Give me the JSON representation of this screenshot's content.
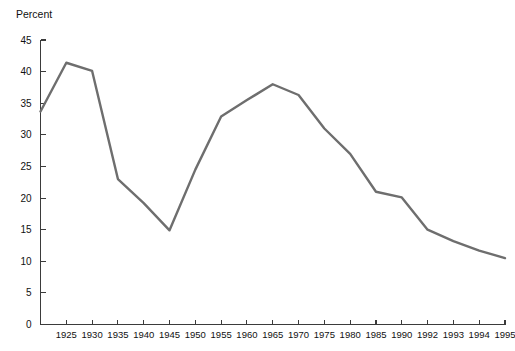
{
  "chart_data": {
    "type": "line",
    "title": "",
    "subtitle": "",
    "ylabel": "Percent",
    "xlabel": "",
    "ylim": [
      0,
      45
    ],
    "ytick_values": [
      0,
      5,
      10,
      15,
      20,
      25,
      30,
      35,
      40,
      45
    ],
    "ytick_labels": [
      "0",
      "5",
      "10",
      "15",
      "20",
      "25",
      "30",
      "35",
      "40",
      "45"
    ],
    "grid": false,
    "legend": false,
    "legend_position": "none",
    "line_color": "#6e6e6e",
    "axis_color": "#3b3b3b",
    "categories": [
      "1920",
      "1925",
      "1930",
      "1935",
      "1940",
      "1945",
      "1950",
      "1955",
      "1960",
      "1965",
      "1970",
      "1975",
      "1980",
      "1985",
      "1990",
      "1992",
      "1993",
      "1994",
      "1995"
    ],
    "xtick_labels": [
      "",
      "1925",
      "1930",
      "1935",
      "1940",
      "1945",
      "1950",
      "1955",
      "1960",
      "1965",
      "1970",
      "1975",
      "1980",
      "1985",
      "1990",
      "1992",
      "1993",
      "1994",
      "1995"
    ],
    "series": [
      {
        "name": "Percent",
        "values": [
          33.7,
          41.4,
          40.1,
          23.0,
          19.2,
          14.9,
          24.5,
          32.9,
          35.5,
          38.0,
          36.3,
          31.0,
          27.0,
          21.0,
          20.1,
          15.0,
          13.2,
          11.7,
          10.5
        ]
      }
    ]
  },
  "axis_labels": {
    "y_title": "Percent"
  }
}
